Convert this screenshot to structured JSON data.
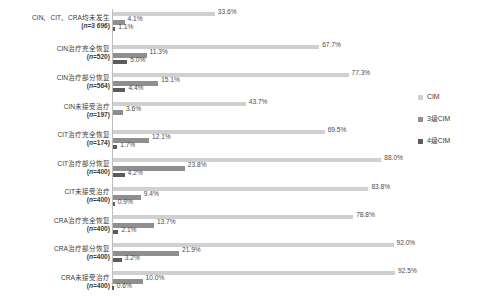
{
  "chart_data": {
    "type": "bar",
    "orientation": "horizontal",
    "title": "",
    "xlabel": "",
    "ylabel": "",
    "xlim": [
      0,
      100
    ],
    "grid": false,
    "legend_position": "right",
    "value_suffix": "%",
    "categories": [
      {
        "line1": "CIN、CIT、CRA均未发生",
        "line2_prefix": "(",
        "line2_n": "n",
        "line2_suffix": "=3 696)"
      },
      {
        "line1": "CIN治疗完全恢复",
        "line2_prefix": "(",
        "line2_n": "n",
        "line2_suffix": "=520)"
      },
      {
        "line1": "CIN治疗部分恢复",
        "line2_prefix": "(",
        "line2_n": "n",
        "line2_suffix": "=564)"
      },
      {
        "line1": "CIN未接受治疗",
        "line2_prefix": "(",
        "line2_n": "n",
        "line2_suffix": "=197)"
      },
      {
        "line1": "CIT治疗完全恢复",
        "line2_prefix": "(",
        "line2_n": "n",
        "line2_suffix": "=174)"
      },
      {
        "line1": "CIT治疗部分恢复",
        "line2_prefix": "(",
        "line2_n": "n",
        "line2_suffix": "=400)"
      },
      {
        "line1": "CIT未接受治疗",
        "line2_prefix": "(",
        "line2_n": "n",
        "line2_suffix": "=400)"
      },
      {
        "line1": "CRA治疗完全恢复",
        "line2_prefix": "(",
        "line2_n": "n",
        "line2_suffix": "=400)"
      },
      {
        "line1": "CRA治疗部分恢复",
        "line2_prefix": "(",
        "line2_n": "n",
        "line2_suffix": "=400)"
      },
      {
        "line1": "CRA未接受治疗",
        "line2_prefix": "(",
        "line2_n": "n",
        "line2_suffix": "=400)"
      }
    ],
    "series": [
      {
        "name": "CIM",
        "color": "#d0d0d0",
        "values": [
          33.6,
          67.7,
          77.3,
          43.7,
          69.5,
          88.0,
          83.8,
          78.8,
          92.0,
          92.5
        ],
        "labels": [
          "33.6%",
          "67.7%",
          "77.3%",
          "43.7%",
          "69.5%",
          "88.0%",
          "83.8%",
          "78.8%",
          "92.0%",
          "92.5%"
        ]
      },
      {
        "name": "3级CIM",
        "color": "#8f8f8f",
        "values": [
          4.1,
          11.3,
          15.1,
          3.6,
          12.1,
          23.8,
          9.4,
          13.7,
          21.9,
          10.0
        ],
        "labels": [
          "4.1%",
          "11.3%",
          "15.1%",
          "3.6%",
          "12.1%",
          "23.8%",
          "9.4%",
          "13.7%",
          "21.9%",
          "10.0%"
        ]
      },
      {
        "name": "4级CIM",
        "color": "#5c5c5c",
        "values": [
          1.1,
          5.0,
          4.4,
          null,
          1.7,
          4.2,
          0.9,
          2.1,
          3.2,
          0.6
        ],
        "labels": [
          "1.1%",
          "5.0%",
          "4.4%",
          "",
          "1.7%",
          "4.2%",
          "0.9%",
          "2.1%",
          "3.2%",
          "0.6%"
        ]
      }
    ]
  },
  "legend": {
    "items": [
      {
        "label": "CIM",
        "color": "#d0d0d0"
      },
      {
        "label": "3级CIM",
        "color": "#8f8f8f"
      },
      {
        "label": "4级CIM",
        "color": "#5c5c5c"
      }
    ]
  }
}
